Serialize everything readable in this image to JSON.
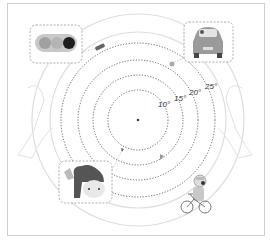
{
  "diagram": {
    "center": {
      "x": 138,
      "y": 120
    },
    "rings": [
      {
        "radius": 30,
        "label": "10°"
      },
      {
        "radius": 45,
        "label": "15°"
      },
      {
        "radius": 60,
        "label": "20°"
      },
      {
        "radius": 77,
        "label": "25°"
      }
    ],
    "outer_arcs": [
      88,
      106
    ],
    "callouts": [
      {
        "id": "traffic-light",
        "icon": "traffic-light-icon"
      },
      {
        "id": "car",
        "icon": "car-icon"
      },
      {
        "id": "girl",
        "icon": "girl-face-icon"
      }
    ],
    "figures": [
      {
        "id": "cyclist",
        "icon": "cyclist-icon"
      }
    ],
    "ring_objects": [
      {
        "icon": "small-vehicle-icon"
      },
      {
        "icon": "small-person-icon"
      },
      {
        "icon": "small-sign-icon"
      },
      {
        "icon": "small-flag-icon"
      }
    ],
    "colors": {
      "ring": "#444444",
      "outer_arc": "#dddddd",
      "callout_border": "#999999",
      "grey_fill": "#9a9a9a",
      "dark": "#222222"
    }
  }
}
